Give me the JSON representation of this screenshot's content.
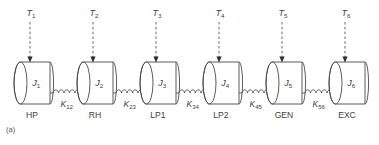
{
  "figure": {
    "caption": "(a)",
    "colors": {
      "background": "#ffffff",
      "line": "#4a4a4a",
      "arrow": "#2e2e2e",
      "text": "#3d3d3d"
    },
    "layout": {
      "mass_count": 6,
      "spring_count": 5,
      "first_mass_left_x": 14,
      "mass_pitch": 63,
      "mass_body_width": 36,
      "mass_body_height": 42,
      "mass_top_y": 62,
      "ellipse_rx": 6.5,
      "ellipse_ry": 21,
      "spring_coils": 5,
      "torque_label_y": 16,
      "dash_top_y": 22,
      "stage_label_y": 118
    }
  },
  "masses": [
    {
      "id": "mass-1",
      "inertia_symbol": "J",
      "inertia_subscript": "1",
      "torque_symbol": "T",
      "torque_subscript": "1",
      "stage_label": "HP",
      "stage_name": "high-pressure-turbine"
    },
    {
      "id": "mass-2",
      "inertia_symbol": "J",
      "inertia_subscript": "2",
      "torque_symbol": "T",
      "torque_subscript": "2",
      "stage_label": "RH",
      "stage_name": "reheat-turbine"
    },
    {
      "id": "mass-3",
      "inertia_symbol": "J",
      "inertia_subscript": "3",
      "torque_symbol": "T",
      "torque_subscript": "3",
      "stage_label": "LP1",
      "stage_name": "low-pressure-turbine-1"
    },
    {
      "id": "mass-4",
      "inertia_symbol": "J",
      "inertia_subscript": "4",
      "torque_symbol": "T",
      "torque_subscript": "4",
      "stage_label": "LP2",
      "stage_name": "low-pressure-turbine-2"
    },
    {
      "id": "mass-5",
      "inertia_symbol": "J",
      "inertia_subscript": "5",
      "torque_symbol": "T",
      "torque_subscript": "5",
      "stage_label": "GEN",
      "stage_name": "generator"
    },
    {
      "id": "mass-6",
      "inertia_symbol": "J",
      "inertia_subscript": "6",
      "torque_symbol": "T",
      "torque_subscript": "6",
      "stage_label": "EXC",
      "stage_name": "exciter"
    }
  ],
  "springs": [
    {
      "id": "spring-1",
      "stiffness_symbol": "K",
      "stiffness_subscript": "12",
      "connects": "mass-1-to-mass-2"
    },
    {
      "id": "spring-2",
      "stiffness_symbol": "K",
      "stiffness_subscript": "23",
      "connects": "mass-2-to-mass-3"
    },
    {
      "id": "spring-3",
      "stiffness_symbol": "K",
      "stiffness_subscript": "34",
      "connects": "mass-3-to-mass-4"
    },
    {
      "id": "spring-4",
      "stiffness_symbol": "K",
      "stiffness_subscript": "45",
      "connects": "mass-4-to-mass-5"
    },
    {
      "id": "spring-5",
      "stiffness_symbol": "K",
      "stiffness_subscript": "56",
      "connects": "mass-5-to-mass-6"
    }
  ]
}
